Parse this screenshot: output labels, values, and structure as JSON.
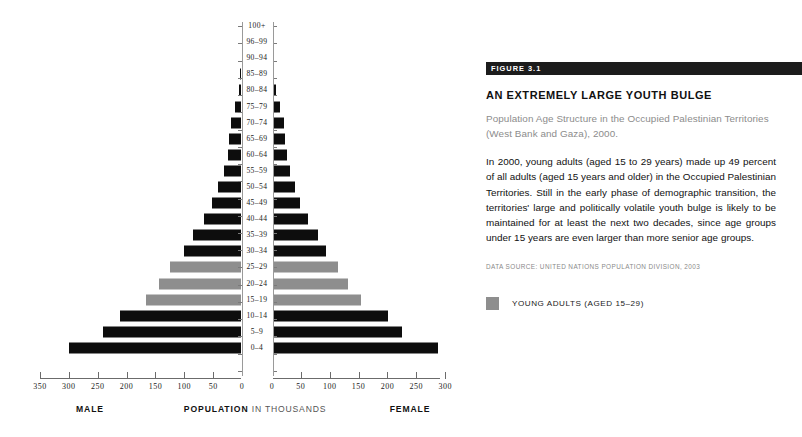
{
  "figure": {
    "badge": "FIGURE 3.1",
    "title": "AN EXTREMELY LARGE YOUTH BULGE",
    "subtitle": "Population Age Structure in the Occupied Palestinian Territories (West Bank and Gaza), 2000.",
    "body": "In 2000, young adults (aged 15 to 29 years) made up 49 percent of all adults (aged 15 years and older) in the Occupied Palestinian Territories. Still in the early phase of demographic transition, the territories' large and politically volatile youth bulge is likely to be maintained for at least the next two decades, since age groups under 15 years are even larger than more senior age groups.",
    "source": "DATA SOURCE: UNITED NATIONS POPULATION DIVISION, 2003",
    "legend": {
      "swatch_color": "#8e8e8e",
      "label": "YOUNG ADULTS (AGED 15–29)"
    }
  },
  "axis_titles": {
    "male": "MALE",
    "population_bold": "POPULATION",
    "population_light": "IN THOUSANDS",
    "female": "FEMALE"
  },
  "chart_data": {
    "type": "bar",
    "subtype": "population-pyramid",
    "title": "AN EXTREMELY LARGE YOUTH BULGE",
    "subtitle": "Population Age Structure in the Occupied Palestinian Territories (West Bank and Gaza), 2000.",
    "xlabel": "POPULATION IN THOUSANDS",
    "ylabel": "Age group",
    "xlim": [
      0,
      350
    ],
    "xticks": [
      0,
      50,
      100,
      150,
      200,
      250,
      300,
      350
    ],
    "grid": false,
    "legend_position": "below-right",
    "colors": {
      "default": "#0d0d0d",
      "highlight": "#8e8e8e"
    },
    "highlight_categories": [
      "15–19",
      "20–24",
      "25–29"
    ],
    "categories": [
      "100+",
      "96–99",
      "90–94",
      "85–89",
      "80–84",
      "75–79",
      "70–74",
      "65–69",
      "60–64",
      "55–59",
      "50–54",
      "45–49",
      "40–44",
      "35–39",
      "30–34",
      "25–29",
      "20–24",
      "15–19",
      "10–14",
      "5–9",
      "0–4"
    ],
    "series": [
      {
        "name": "MALE",
        "side": "left",
        "values": [
          0,
          0,
          0,
          3,
          6,
          12,
          19,
          23,
          25,
          32,
          42,
          52,
          66,
          85,
          100,
          124,
          144,
          166,
          212,
          240,
          300
        ]
      },
      {
        "name": "FEMALE",
        "side": "right",
        "values": [
          0,
          0,
          0,
          3,
          7,
          13,
          20,
          23,
          26,
          31,
          39,
          49,
          62,
          80,
          94,
          115,
          132,
          155,
          201,
          226,
          287
        ]
      }
    ]
  }
}
